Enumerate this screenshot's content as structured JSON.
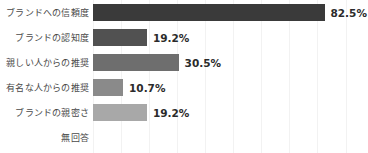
{
  "chart_data": {
    "type": "bar",
    "orientation": "horizontal",
    "title": "",
    "subtitle": "",
    "xlabel": "",
    "ylabel": "",
    "xlim": [
      0,
      100
    ],
    "grid": true,
    "grid_axis": "x",
    "grid_step": 10,
    "legend": false,
    "legend_position": "none",
    "value_suffix": "%",
    "categories": [
      "ブランドへの信頼度",
      "ブランドの認知度",
      "親しい人からの推奨",
      "有名な人からの推奨",
      "ブランドの親密さ",
      "無回答"
    ],
    "values": [
      82.5,
      19.2,
      30.5,
      10.7,
      19.2,
      0
    ],
    "value_labels": [
      "82.5%",
      "19.2%",
      "30.5%",
      "10.7%",
      "19.2%",
      ""
    ],
    "bar_colors": [
      "#3a3a3a",
      "#515151",
      "#6e6e6e",
      "#8a8a8a",
      "#a8a8a8",
      "#c4c4c4"
    ],
    "grid_color": "#f2f2f2",
    "background_color": "#ffffff",
    "label_color": "#4a4a4a",
    "value_color": "#2b2b2b"
  }
}
